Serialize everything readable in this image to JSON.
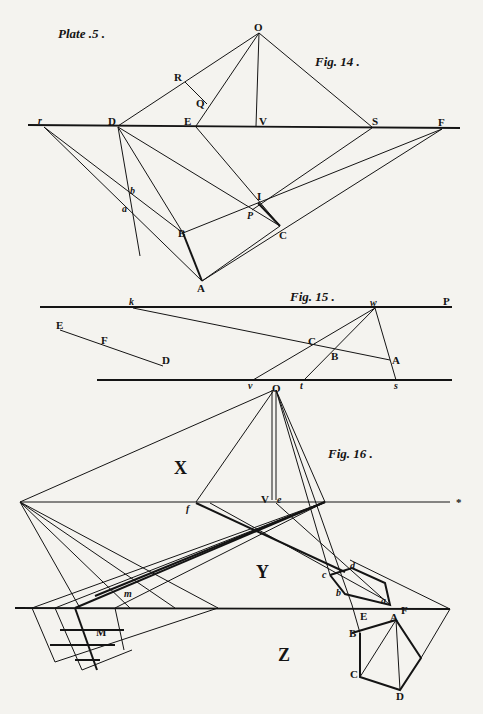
{
  "plate": {
    "title": "Plate .5 ."
  },
  "fig14": {
    "caption": "Fig. 14 .",
    "labels": {
      "O": "O",
      "R": "R",
      "Q": "Q",
      "r": "r",
      "D": "D",
      "E": "E",
      "V": "V",
      "S": "S",
      "F": "F",
      "b": "b",
      "a": "a",
      "I": "I",
      "P": "P",
      "B": "B",
      "C": "C",
      "A": "A"
    }
  },
  "fig15": {
    "caption": "Fig. 15 .",
    "labels": {
      "k": "k",
      "w": "w",
      "P": "P",
      "E": "E",
      "F": "F",
      "D": "D",
      "C": "C",
      "B": "B",
      "A": "A",
      "v": "v",
      "t": "t",
      "s": "s"
    }
  },
  "fig16": {
    "caption": "Fig. 16 .",
    "regions": {
      "X": "X",
      "Y": "Y",
      "Z": "Z"
    },
    "labels": {
      "O": "O",
      "V": "V",
      "e": "e",
      "f": "f",
      "star": "*",
      "m": "m",
      "M": "M",
      "c": "c",
      "d": "d",
      "b": "b",
      "a": "a",
      "E": "E",
      "F": "F",
      "A": "A",
      "B": "B",
      "C": "C",
      "D": "D"
    }
  }
}
